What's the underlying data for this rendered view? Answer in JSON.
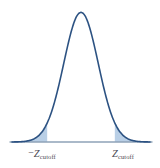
{
  "figure": {
    "name": "normal-distribution-two-tailed-cutoffs",
    "background_color": "#ffffff",
    "width": 160,
    "height": 168
  },
  "labels": {
    "left_cutoff": {
      "negative_sign": "−",
      "symbol": "Z",
      "subscript": "cutoff",
      "full_text": "−Z cutoff"
    },
    "right_cutoff": {
      "symbol": "Z",
      "subscript": "cutoff",
      "full_text": "Z cutoff"
    }
  },
  "colors": {
    "curve_stroke": "#2c5282",
    "tail_fill": "#b9cfe6",
    "axis_line": "#8fa3b8",
    "label_text": "#4a4a52",
    "background": "#ffffff"
  },
  "chart_data": {
    "type": "line",
    "title": "",
    "subtitle": "",
    "xlabel": "",
    "ylabel": "",
    "grid": false,
    "legend": null,
    "axis": {
      "x_axis_shown": true,
      "y_axis_shown": false,
      "x_baseline_y_pixel": 142,
      "x_start_pixel": 10,
      "x_end_pixel": 152
    },
    "distribution": "standard normal",
    "mean": 0,
    "std_dev": 1,
    "peak_pixel": {
      "x": 81,
      "y": 12
    },
    "xlim": [
      -4.0,
      4.0
    ],
    "ylim": [
      0,
      0.4
    ],
    "x": [
      -4.0,
      -3.75,
      -3.5,
      -3.25,
      -3.0,
      -2.75,
      -2.5,
      -2.25,
      -2.0,
      -1.75,
      -1.5,
      -1.25,
      -1.0,
      -0.75,
      -0.5,
      -0.25,
      0.0,
      0.25,
      0.5,
      0.75,
      1.0,
      1.25,
      1.5,
      1.75,
      2.0,
      2.25,
      2.5,
      2.75,
      3.0,
      3.25,
      3.5,
      3.75,
      4.0
    ],
    "y": [
      0.0001,
      0.0004,
      0.0009,
      0.002,
      0.0044,
      0.0091,
      0.0175,
      0.0317,
      0.054,
      0.0863,
      0.1295,
      0.1826,
      0.242,
      0.3011,
      0.3521,
      0.3867,
      0.3989,
      0.3867,
      0.3521,
      0.3011,
      0.242,
      0.1826,
      0.1295,
      0.0863,
      0.054,
      0.0317,
      0.0175,
      0.0091,
      0.0044,
      0.002,
      0.0009,
      0.0004,
      0.0001
    ],
    "shaded_regions": [
      {
        "name": "left-tail",
        "from": -4.0,
        "to": -1.96,
        "label": "−Z cutoff",
        "fill": "#b9cfe6",
        "pixel_from": 12,
        "pixel_to": 41
      },
      {
        "name": "right-tail",
        "from": 1.96,
        "to": 4.0,
        "label": "Z cutoff",
        "fill": "#b9cfe6",
        "pixel_from": 119,
        "pixel_to": 150
      }
    ],
    "annotations": [
      {
        "name": "left-cutoff-tick",
        "x": -1.96,
        "text": "−Z cutoff",
        "pixel_x": 42
      },
      {
        "name": "right-cutoff-tick",
        "x": 1.96,
        "text": "Z cutoff",
        "pixel_x": 123
      }
    ]
  }
}
